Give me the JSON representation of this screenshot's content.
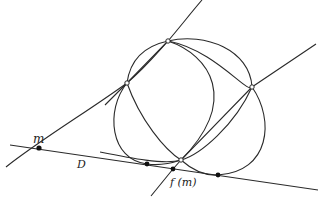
{
  "diagram": {
    "labels": {
      "m": "m",
      "D": "D",
      "fm": "f (m)"
    },
    "points": {
      "top": [
        168,
        41
      ],
      "left": [
        127,
        83
      ],
      "right": [
        252,
        87
      ],
      "bottom": [
        181,
        160
      ],
      "m": [
        39,
        148
      ],
      "d_left": [
        147,
        164
      ],
      "fm": [
        173,
        169
      ],
      "d_right": [
        218,
        175
      ]
    },
    "stroke_color": "#2a2a2a"
  }
}
